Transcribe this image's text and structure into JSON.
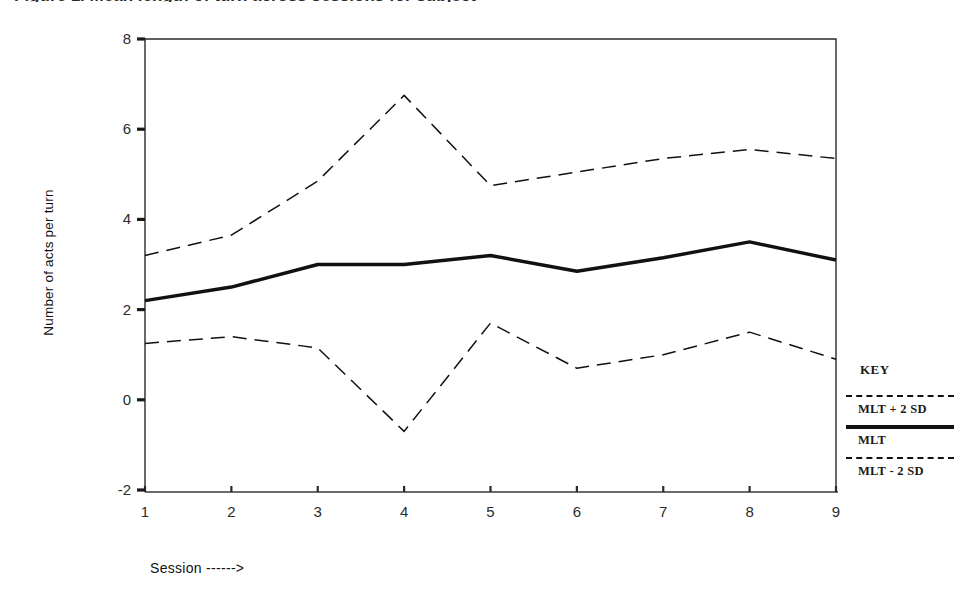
{
  "figure": {
    "title_remnant": "Figure 1. Mean length of turn across sessions for subject",
    "axes": {
      "ylabel": "Number of acts per turn",
      "xlabel": "Session ------>",
      "yticks": [
        8,
        6,
        4,
        2,
        0,
        -2
      ],
      "xticks": [
        1,
        2,
        3,
        4,
        5,
        6,
        7,
        8,
        9
      ]
    },
    "legend": {
      "title": "KEY",
      "entries": [
        {
          "style": "dashed",
          "label": "MLT + 2 SD"
        },
        {
          "style": "solid",
          "label": "MLT"
        },
        {
          "style": "dashed",
          "label": "MLT - 2 SD"
        }
      ]
    }
  },
  "chart_data": {
    "type": "line",
    "title": "",
    "xlabel": "Session ------>",
    "ylabel": "Number of acts per turn",
    "x": [
      1,
      2,
      3,
      4,
      5,
      6,
      7,
      8,
      9
    ],
    "xlim": [
      1,
      9
    ],
    "ylim": [
      -2,
      8
    ],
    "grid": false,
    "legend_position": "right",
    "series": [
      {
        "name": "MLT + 2 SD",
        "style": "dashed",
        "values": [
          3.2,
          3.65,
          4.85,
          6.75,
          4.75,
          5.05,
          5.35,
          5.55,
          5.35
        ]
      },
      {
        "name": "MLT",
        "style": "solid-thick",
        "values": [
          2.2,
          2.5,
          3.0,
          3.0,
          3.2,
          2.85,
          3.15,
          3.5,
          3.1
        ]
      },
      {
        "name": "MLT - 2 SD",
        "style": "dashed",
        "values": [
          1.25,
          1.4,
          1.15,
          -0.7,
          1.7,
          0.7,
          1.0,
          1.5,
          0.9
        ]
      }
    ]
  }
}
